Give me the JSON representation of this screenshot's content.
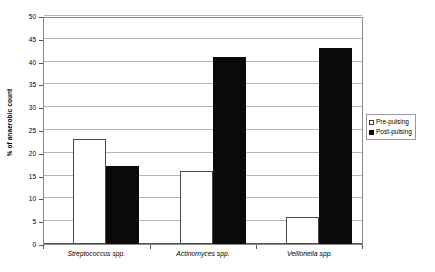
{
  "chart_data": {
    "type": "bar",
    "title": "",
    "subtitle": "",
    "xlabel": "",
    "ylabel": "% of anaerobic count",
    "ylim": [
      0,
      50
    ],
    "ytick_step": 5,
    "yticks": [
      0,
      5,
      10,
      15,
      20,
      25,
      30,
      35,
      40,
      45,
      50
    ],
    "ytick_labels": [
      "0",
      "5",
      "10",
      "15",
      "20",
      "25",
      "30",
      "35",
      "40",
      "45",
      "50"
    ],
    "grid": "horizontal",
    "grid_color": "#b4b4b4",
    "legend_position": "right-outside",
    "categories": [
      "Streptococcus spp.",
      "Actinomyces spp.",
      "Veillonella spp."
    ],
    "categories_style": "italic",
    "series": [
      {
        "name": "Pre-pulsing",
        "values": [
          23,
          16,
          6
        ],
        "fill": "#ffffff",
        "edge": "#4a4a4a"
      },
      {
        "name": "Post-pulsing",
        "values": [
          17,
          41,
          43
        ],
        "fill": "#0a0a0a",
        "edge": "#0a0a0a"
      }
    ],
    "annotations": []
  },
  "legend": {
    "items": [
      {
        "label": "Pre-pulsing",
        "swatch": "hollow-square-swatch"
      },
      {
        "label": "Post-pulsing",
        "swatch": "filled-square-swatch"
      }
    ]
  }
}
